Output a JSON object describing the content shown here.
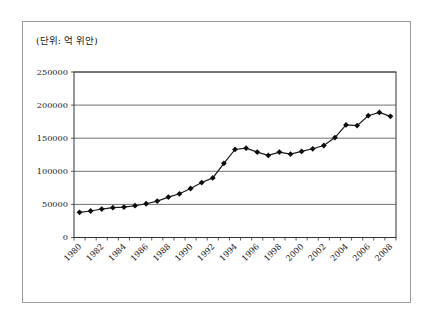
{
  "frame": {
    "unit_caption": "(단위: 억 위안)"
  },
  "chart_data": {
    "type": "line",
    "title": "",
    "xlabel": "",
    "ylabel": "",
    "unit_label": "(단위: 억 위안)",
    "x": [
      1980,
      1981,
      1982,
      1983,
      1984,
      1985,
      1986,
      1987,
      1988,
      1989,
      1990,
      1991,
      1992,
      1993,
      1994,
      1995,
      1996,
      1997,
      1998,
      1999,
      2000,
      2001,
      2002,
      2003,
      2004,
      2005,
      2006,
      2007,
      2008
    ],
    "series": [
      {
        "name": "value",
        "values": [
          38000,
          40000,
          43000,
          45000,
          46000,
          48000,
          51000,
          55000,
          61000,
          66000,
          74000,
          83000,
          90000,
          112000,
          133000,
          135000,
          129000,
          124000,
          129000,
          126000,
          130000,
          134000,
          139000,
          151000,
          170000,
          169000,
          184000,
          189000,
          183000
        ]
      }
    ],
    "ylim": [
      0,
      250000
    ],
    "yticks": [
      0,
      50000,
      100000,
      150000,
      200000,
      250000
    ],
    "ytick_labels": [
      "0",
      "50000",
      "100000",
      "150000",
      "200000",
      "250000"
    ],
    "xtick_labels": [
      "1980",
      "1982",
      "1984",
      "1986",
      "1988",
      "1990",
      "1992",
      "1994",
      "1996",
      "1998",
      "2000",
      "2002",
      "2004",
      "2006",
      "2008"
    ],
    "xtick_label_every": 2,
    "grid": "horizontal",
    "legend": "none",
    "marker": "diamond",
    "colors": {
      "line": "#1a1a1a",
      "marker": "#0d0d0d",
      "grid": "#4d4d4d",
      "plot_border": "#333333",
      "frame_border": "#9a9a9a",
      "background": "#ffffff"
    }
  }
}
